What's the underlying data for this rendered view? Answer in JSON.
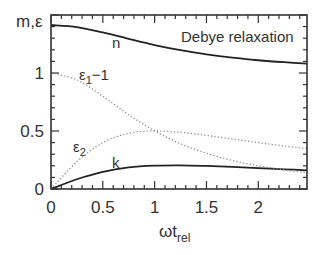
{
  "chart_data": {
    "type": "line",
    "title": "Debye relaxation",
    "xlabel": "ωt",
    "xlabel_sub": "rel",
    "ylabel": "m,ε",
    "xlim": [
      0,
      2.47
    ],
    "ylim": [
      0,
      1.5
    ],
    "grid": false,
    "legend": "none (curves labelled inline)",
    "x_ticks": [
      0,
      0.5,
      1,
      1.5,
      2
    ],
    "x_tick_labels": [
      "0",
      "0.5",
      "1",
      "1.5",
      "2"
    ],
    "y_ticks": [
      0,
      0.5,
      1
    ],
    "y_tick_labels": [
      "0",
      "0.5",
      "1"
    ],
    "minor_tick_step": 0.1,
    "x": [
      0,
      0.25,
      0.5,
      0.75,
      1.0,
      1.25,
      1.5,
      1.75,
      2.0,
      2.25,
      2.5
    ],
    "series": [
      {
        "name": "n",
        "style": "solid",
        "values": [
          1.414,
          1.396,
          1.35,
          1.294,
          1.241,
          1.197,
          1.161,
          1.132,
          1.11,
          1.093,
          1.079
        ]
      },
      {
        "name": "k",
        "style": "solid",
        "values": [
          0.0,
          0.084,
          0.148,
          0.186,
          0.201,
          0.204,
          0.199,
          0.191,
          0.18,
          0.17,
          0.16
        ]
      },
      {
        "name": "ε1−1",
        "style": "dotted",
        "values": [
          1.0,
          0.941,
          0.8,
          0.64,
          0.5,
          0.39,
          0.308,
          0.246,
          0.2,
          0.165,
          0.138
        ]
      },
      {
        "name": "ε2",
        "style": "dotted",
        "values": [
          0.0,
          0.235,
          0.4,
          0.48,
          0.5,
          0.488,
          0.462,
          0.431,
          0.4,
          0.371,
          0.345
        ]
      }
    ],
    "annotations": [
      {
        "text": "n",
        "x": 0.62,
        "y": 1.22
      },
      {
        "text": "ε",
        "sub": "1",
        "suffix": "−1",
        "x": 0.27,
        "y": 0.93
      },
      {
        "text": "ε",
        "sub": "2",
        "x": 0.21,
        "y": 0.3
      },
      {
        "text": "k",
        "x": 0.6,
        "y": 0.24
      },
      {
        "text": "Debye relaxation",
        "x": 1.26,
        "y": 1.24
      }
    ]
  },
  "labels": {
    "ylabel": "m,ε",
    "xlabel_main": "ωt",
    "xlabel_sub": "rel",
    "title": "Debye relaxation",
    "n": "n",
    "k": "k",
    "eps": "ε",
    "eps1_sub": "1",
    "eps1_suffix": "−1",
    "eps2_sub": "2"
  },
  "style": {
    "solid_color": "#222222",
    "dotted_color": "#8a8a8a",
    "axis_color": "#333333"
  }
}
